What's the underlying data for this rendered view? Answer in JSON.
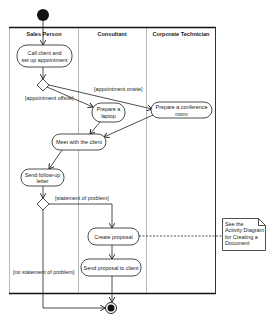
{
  "diagram": {
    "type": "UML activity diagram",
    "lanes": [
      {
        "label": "Sales Person"
      },
      {
        "label": "Consultant"
      },
      {
        "label": "Corporate Technician"
      }
    ],
    "activities": {
      "call_client": {
        "line1": "Call client and",
        "line2": "set up appointment"
      },
      "prepare_laptop": {
        "line1": "Prepare a",
        "line2": "laptop"
      },
      "prepare_room": {
        "line1": "Prepare a conference",
        "line2": "room"
      },
      "meet_client": {
        "line1": "Meet with the client"
      },
      "follow_up": {
        "line1": "Send follow-up",
        "line2": "letter"
      },
      "create_proposal": {
        "line1": "Create proposal"
      },
      "send_proposal": {
        "line1": "Send proposal to client"
      }
    },
    "guards": {
      "onsite": "[appointment onsite]",
      "offsite": "[appointment offsite]",
      "problem": "[statement of problem]",
      "no_problem": "[no statement of problem]"
    },
    "note": {
      "line1": "See the",
      "line2": "Activity Diagram",
      "line3": "for Creating a",
      "line4": "Document"
    }
  }
}
